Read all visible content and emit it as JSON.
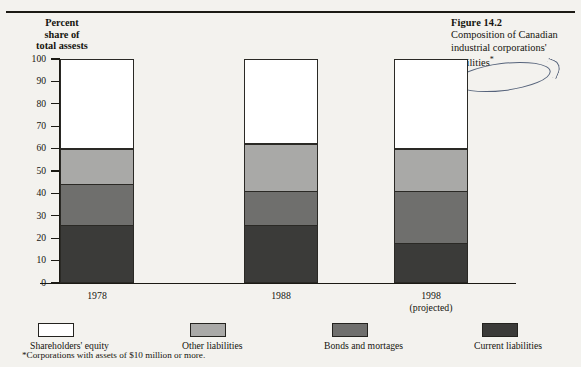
{
  "figure": {
    "number": "Figure 14.2",
    "caption": "Composition of Canadian industrial corporations' liabilities",
    "caption_marker": "*"
  },
  "axis": {
    "y_title_lines": [
      "Percent",
      "share of",
      "total assests"
    ],
    "y_ticks": [
      "100",
      "90",
      "80",
      "70",
      "60",
      "50",
      "40",
      "30",
      "20",
      "10",
      "0"
    ]
  },
  "footnote": "*Corporations with assets of $10 million or more.",
  "legend": {
    "items": [
      {
        "label": "Shareholders' equity",
        "color": "#ffffff"
      },
      {
        "label": "Other liabilities",
        "color": "#a9a9a7"
      },
      {
        "label": "Bonds and mortages",
        "color": "#6f6f6d"
      },
      {
        "label": "Current liabilities",
        "color": "#3b3b39"
      }
    ]
  },
  "xlabels": [
    {
      "year": "1978",
      "sub": ""
    },
    {
      "year": "1988",
      "sub": ""
    },
    {
      "year": "1998",
      "sub": "(projected)"
    }
  ],
  "chart_data": {
    "type": "bar",
    "stacked": true,
    "title": "Composition of Canadian industrial corporations' liabilities*",
    "xlabel": "",
    "ylabel": "Percent share of total assests",
    "ylim": [
      0,
      100
    ],
    "ytick_step": 10,
    "grid": false,
    "legend_position": "bottom",
    "categories": [
      "1978",
      "1988",
      "1998 (projected)"
    ],
    "series": [
      {
        "name": "Current liabilities",
        "color": "#3b3b39",
        "values": [
          26,
          26,
          18
        ]
      },
      {
        "name": "Bonds and mortages",
        "color": "#6f6f6d",
        "values": [
          18,
          15,
          23
        ]
      },
      {
        "name": "Other liabilities",
        "color": "#a9a9a7",
        "values": [
          16,
          21,
          19
        ]
      },
      {
        "name": "Shareholders' equity",
        "color": "#ffffff",
        "values": [
          40,
          38,
          40
        ]
      }
    ],
    "cumulative_tops": {
      "1978": {
        "current_liabilities": 26,
        "bonds_and_mortages": 44,
        "other_liabilities": 60,
        "shareholders_equity": 100
      },
      "1988": {
        "current_liabilities": 26,
        "bonds_and_mortages": 41,
        "other_liabilities": 62,
        "shareholders_equity": 100
      },
      "1998": {
        "current_liabilities": 18,
        "bonds_and_mortages": 41,
        "other_liabilities": 60,
        "shareholders_equity": 100
      }
    },
    "annotation": "ellipse drawn around the words \"corporations' liabilities\" in the figure caption"
  }
}
